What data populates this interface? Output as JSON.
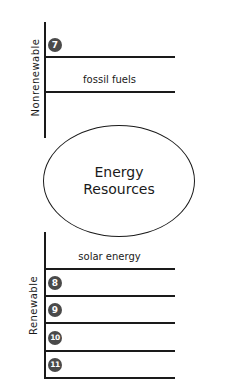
{
  "diagram": {
    "center": {
      "line1": "Energy",
      "line2": "Resources"
    },
    "categories": {
      "nonrenewable": {
        "label": "Nonrenewable",
        "items": [
          {
            "badge": "7",
            "text": ""
          },
          {
            "badge": "",
            "text": "fossil fuels"
          }
        ]
      },
      "renewable": {
        "label": "Renewable",
        "items": [
          {
            "badge": "",
            "text": "solar energy"
          },
          {
            "badge": "8",
            "text": ""
          },
          {
            "badge": "9",
            "text": ""
          },
          {
            "badge": "10",
            "text": ""
          },
          {
            "badge": "11",
            "text": ""
          }
        ]
      }
    },
    "colors": {
      "line": "#1a1a1a",
      "badge": "#4a4a4a"
    }
  }
}
